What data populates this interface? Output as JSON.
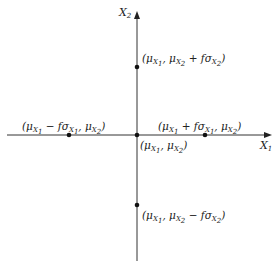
{
  "diagram": {
    "axes": {
      "x_label": {
        "base": "X",
        "sub": "1"
      },
      "y_label": {
        "base": "X",
        "sub": "2"
      }
    },
    "points": {
      "origin": {
        "text": "(μX1, μX2)",
        "x": 136,
        "y": 135
      },
      "right": {
        "text": "(μX1 + fσX1, μX2)",
        "x": 205,
        "y": 135
      },
      "left": {
        "text": "(μX1 − fσX1, μX2)",
        "x": 69,
        "y": 135
      },
      "top": {
        "text": "(μX1, μX2 + fσX2)",
        "x": 137,
        "y": 67
      },
      "bottom": {
        "text": "(μX1, μX2 − fσX2)",
        "x": 137,
        "y": 205
      }
    },
    "colors": {
      "line": "#333333",
      "point": "#111111"
    }
  }
}
